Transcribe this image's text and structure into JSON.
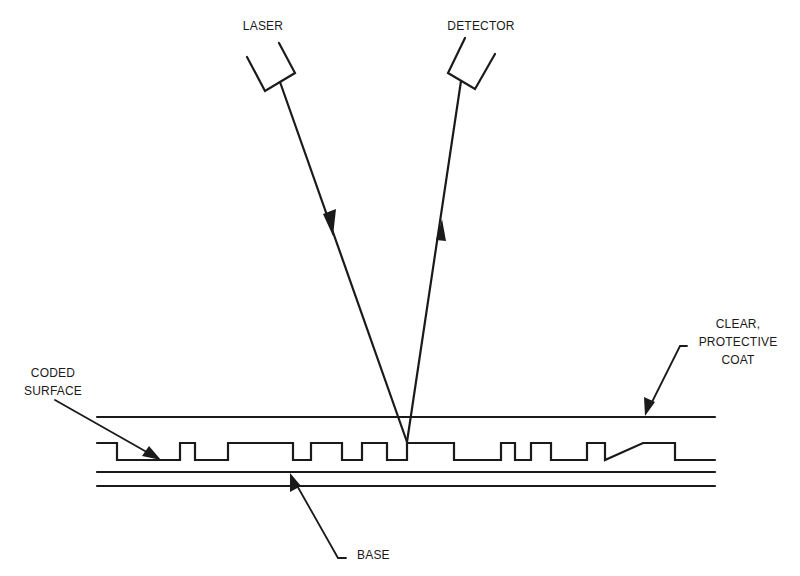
{
  "diagram": {
    "title": "",
    "type": "optical-disc-readout-cross-section",
    "colors": {
      "ink": "#1a1a1a",
      "background": "#ffffff"
    },
    "labels": {
      "laser": "LASER",
      "detector": "DETECTOR",
      "coat": [
        "CLEAR,",
        "PROTECTIVE",
        "COAT"
      ],
      "coded_surface": [
        "CODED",
        "SURFACE"
      ],
      "base": "BASE"
    },
    "components": [
      {
        "id": "laser",
        "label": "LASER",
        "role": "source"
      },
      {
        "id": "detector",
        "label": "DETECTOR",
        "role": "receiver"
      },
      {
        "id": "coat",
        "label": "CLEAR, PROTECTIVE COAT",
        "role": "layer"
      },
      {
        "id": "coded-surface",
        "label": "CODED SURFACE",
        "role": "layer"
      },
      {
        "id": "base",
        "label": "BASE",
        "role": "layer"
      }
    ],
    "beams": [
      {
        "from": "laser",
        "to": "coded-surface",
        "direction": "incident"
      },
      {
        "from": "coded-surface",
        "to": "detector",
        "direction": "reflected"
      }
    ],
    "profile": {
      "x_start": 97,
      "x_end": 715,
      "high_y": 443,
      "low_y": 460,
      "transitions": [
        117,
        180,
        195,
        228,
        293,
        311,
        342,
        362,
        387,
        407,
        454,
        501,
        515,
        531,
        551,
        587,
        605,
        643,
        675
      ]
    }
  }
}
